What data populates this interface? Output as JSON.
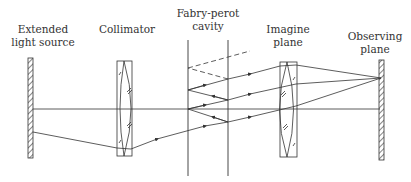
{
  "diagram": {
    "labels": {
      "source_line1": "Extended",
      "source_line2": "light source",
      "collimator": "Collimator",
      "cavity_line1": "Fabry-perot",
      "cavity_line2": "cavity",
      "imagine_line1": "Imagine",
      "imagine_line2": "plane",
      "observing_line1": "Observing",
      "observing_line2": "plane"
    },
    "colors": {
      "line": "#333333",
      "background": "#ffffff"
    }
  }
}
